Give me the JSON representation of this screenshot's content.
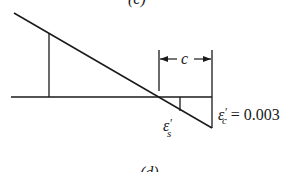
{
  "figure": {
    "top_caption": "(c)",
    "bottom_caption": "(d)",
    "dimension_label": "c",
    "steel_strain_label": {
      "symbol": "ε",
      "prime": "′",
      "subscript": "s"
    },
    "concrete_strain_label": {
      "symbol": "ε",
      "prime": "′",
      "subscript": "c",
      "equals": "=",
      "value": "0.003"
    }
  },
  "colors": {
    "line": "#1a1a1a",
    "caption": "#555555",
    "background": "#ffffff"
  }
}
